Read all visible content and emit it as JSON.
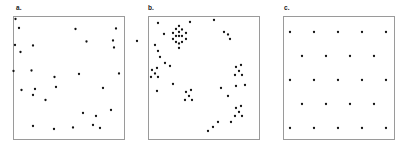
{
  "figure": {
    "width": 408,
    "height": 151,
    "background": "#ffffff",
    "frame_color": "#9a9a9a",
    "point_color": "#111111",
    "point_radius": 1.15
  },
  "panels": [
    {
      "id": "panel-a",
      "label": "a.",
      "label_x": 16,
      "label_y": 5,
      "frame": {
        "x": 13,
        "y": 16,
        "width": 112,
        "height": 124
      },
      "pattern_type": "random",
      "point_count": 30,
      "points": [
        [
          15.5,
          19.0
        ],
        [
          19.0,
          28.0
        ],
        [
          75.5,
          29.0
        ],
        [
          116.0,
          28.5
        ],
        [
          15.0,
          45.0
        ],
        [
          20.5,
          52.0
        ],
        [
          33.0,
          45.5
        ],
        [
          86.5,
          41.5
        ],
        [
          113.0,
          40.5
        ],
        [
          114.0,
          47.5
        ],
        [
          137.0,
          41.0
        ],
        [
          13.5,
          71.0
        ],
        [
          31.5,
          70.5
        ],
        [
          54.5,
          77.0
        ],
        [
          79.0,
          74.0
        ],
        [
          119.0,
          73.5
        ],
        [
          33.0,
          95.0
        ],
        [
          45.5,
          100.0
        ],
        [
          21.5,
          90.0
        ],
        [
          35.0,
          89.0
        ],
        [
          56.0,
          87.0
        ],
        [
          103.0,
          88.0
        ],
        [
          83.0,
          113.0
        ],
        [
          96.0,
          116.0
        ],
        [
          111.0,
          110.0
        ],
        [
          33.0,
          126.0
        ],
        [
          54.0,
          129.0
        ],
        [
          93.0,
          125.0
        ],
        [
          100.0,
          128.0
        ],
        [
          73.0,
          127.5
        ]
      ]
    },
    {
      "id": "panel-b",
      "label": "b.",
      "label_x": 148,
      "label_y": 5,
      "frame": {
        "x": 148,
        "y": 16,
        "width": 112,
        "height": 124
      },
      "pattern_type": "clustered",
      "point_count": 54,
      "points": [
        [
          158.0,
          23.0
        ],
        [
          190.0,
          22.0
        ],
        [
          214.0,
          20.0
        ],
        [
          164.0,
          34.0
        ],
        [
          155.0,
          45.0
        ],
        [
          158.0,
          51.0
        ],
        [
          160.0,
          57.0
        ],
        [
          165.0,
          63.0
        ],
        [
          170.0,
          66.0
        ],
        [
          176.0,
          29.0
        ],
        [
          179.0,
          32.0
        ],
        [
          182.0,
          29.5
        ],
        [
          173.0,
          33.0
        ],
        [
          186.0,
          33.0
        ],
        [
          176.0,
          36.0
        ],
        [
          179.0,
          36.0
        ],
        [
          182.0,
          36.0
        ],
        [
          173.0,
          39.0
        ],
        [
          186.0,
          39.0
        ],
        [
          176.0,
          42.0
        ],
        [
          179.0,
          43.5
        ],
        [
          182.0,
          42.0
        ],
        [
          179.0,
          26.0
        ],
        [
          179.0,
          48.0
        ],
        [
          224.0,
          32.0
        ],
        [
          228.0,
          34.5
        ],
        [
          230.0,
          39.0
        ],
        [
          152.0,
          70.0
        ],
        [
          157.0,
          68.0
        ],
        [
          155.0,
          73.5
        ],
        [
          151.0,
          77.0
        ],
        [
          158.0,
          77.0
        ],
        [
          236.0,
          67.0
        ],
        [
          241.0,
          65.0
        ],
        [
          239.0,
          71.0
        ],
        [
          235.0,
          75.0
        ],
        [
          242.0,
          75.0
        ],
        [
          173.0,
          84.0
        ],
        [
          157.0,
          91.0
        ],
        [
          186.0,
          92.0
        ],
        [
          191.0,
          90.0
        ],
        [
          189.0,
          96.0
        ],
        [
          185.0,
          100.0
        ],
        [
          192.0,
          100.0
        ],
        [
          221.0,
          88.0
        ],
        [
          236.0,
          86.0
        ],
        [
          245.0,
          85.0
        ],
        [
          228.0,
          96.0
        ],
        [
          236.0,
          108.0
        ],
        [
          241.0,
          106.0
        ],
        [
          239.0,
          112.0
        ],
        [
          235.0,
          116.0
        ],
        [
          242.0,
          116.0
        ],
        [
          231.0,
          122.0
        ],
        [
          208.0,
          131.0
        ],
        [
          213.0,
          127.0
        ],
        [
          218.0,
          122.0
        ]
      ]
    },
    {
      "id": "panel-c",
      "label": "c.",
      "label_x": 284,
      "label_y": 5,
      "frame": {
        "x": 283,
        "y": 16,
        "width": 112,
        "height": 124
      },
      "pattern_type": "regular-lattice",
      "point_count": 25,
      "rows": 5,
      "points": [
        [
          290.0,
          32.0
        ],
        [
          314.0,
          32.0
        ],
        [
          338.0,
          32.0
        ],
        [
          362.0,
          32.0
        ],
        [
          386.0,
          32.0
        ],
        [
          302.0,
          56.0
        ],
        [
          326.0,
          56.0
        ],
        [
          350.0,
          56.0
        ],
        [
          374.0,
          56.0
        ],
        [
          290.0,
          80.0
        ],
        [
          314.0,
          80.0
        ],
        [
          338.0,
          80.0
        ],
        [
          362.0,
          80.0
        ],
        [
          386.0,
          80.0
        ],
        [
          302.0,
          104.0
        ],
        [
          326.0,
          104.0
        ],
        [
          350.0,
          104.0
        ],
        [
          374.0,
          104.0
        ],
        [
          290.0,
          128.0
        ],
        [
          314.0,
          128.0
        ],
        [
          338.0,
          128.0
        ],
        [
          362.0,
          128.0
        ],
        [
          386.0,
          128.0
        ]
      ]
    }
  ],
  "chart_data": {
    "type": "scatter",
    "title": "",
    "xlabel": "",
    "ylabel": "",
    "grid": false,
    "legend": "none",
    "panel_count": 3,
    "panel_labels": [
      "a.",
      "b.",
      "c."
    ],
    "panel_descriptions": [
      "Random (Poisson) point pattern",
      "Clustered point pattern with X-shaped aggregates",
      "Regular staggered lattice point pattern"
    ]
  }
}
